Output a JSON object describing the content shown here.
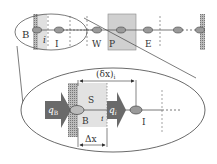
{
  "top_row": {
    "labels": {
      "B": "B",
      "i": "i",
      "I": "I",
      "W": "W",
      "P": "P",
      "E": "E"
    }
  },
  "zoom_detail": {
    "labels": {
      "S": "S",
      "B": "B",
      "i": "i",
      "I": "I",
      "qB": "q",
      "qB_sub": "B",
      "qi": "q",
      "qi_sub": "i",
      "delta_x_i": "(δx)",
      "delta_x_i_sub": "i",
      "Delta_x": "Δx"
    }
  },
  "colors": {
    "node_fill": "#9a9a9a",
    "box_gray": "#d0d0d0",
    "box_light": "#e2e2e2",
    "arrow_dark": "#6a6a6a",
    "line": "#555555"
  }
}
